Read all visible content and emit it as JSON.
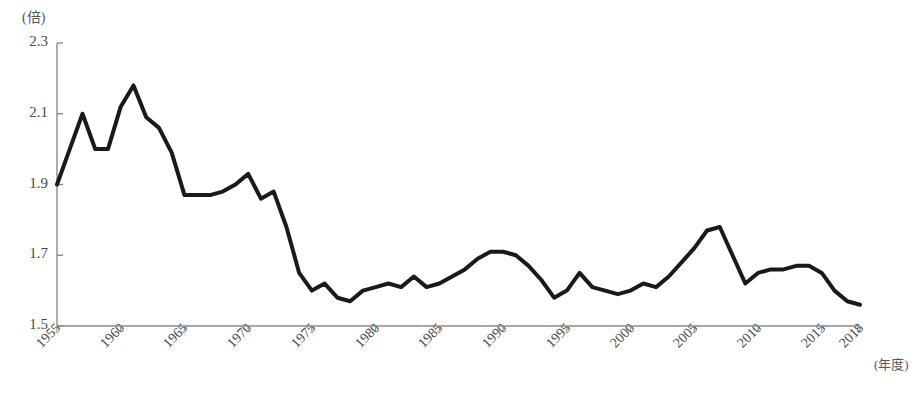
{
  "chart_data": {
    "type": "line",
    "title": "",
    "subtitle": "",
    "xlabel": "(年度)",
    "ylabel": "(倍)",
    "ylim": [
      1.5,
      2.3
    ],
    "xlim": [
      1955,
      2018
    ],
    "ytick_labels": [
      "2.3",
      "2.1",
      "1.9",
      "1.7",
      "1.5"
    ],
    "ytick_values": [
      2.3,
      2.1,
      1.9,
      1.7,
      1.5
    ],
    "xtick_labels": [
      "1955",
      "1960",
      "1965",
      "1970",
      "1975",
      "1980",
      "1985",
      "1990",
      "1995",
      "2000",
      "2005",
      "2010",
      "2015",
      "2018"
    ],
    "xtick_values": [
      1955,
      1960,
      1965,
      1970,
      1975,
      1980,
      1985,
      1990,
      1995,
      2000,
      2005,
      2010,
      2015,
      2018
    ],
    "grid": false,
    "legend": false,
    "legend_position": "none",
    "line_color": "#1a1a1a",
    "axis_color": "#8a8a8a",
    "line_width": 4,
    "series": [
      {
        "name": "倍率",
        "x": [
          1955,
          1956,
          1957,
          1958,
          1959,
          1960,
          1961,
          1962,
          1963,
          1964,
          1965,
          1966,
          1967,
          1968,
          1969,
          1970,
          1971,
          1972,
          1973,
          1974,
          1975,
          1976,
          1977,
          1978,
          1979,
          1980,
          1981,
          1982,
          1983,
          1984,
          1985,
          1986,
          1987,
          1988,
          1989,
          1990,
          1991,
          1992,
          1993,
          1994,
          1995,
          1996,
          1997,
          1998,
          1999,
          2000,
          2001,
          2002,
          2003,
          2004,
          2005,
          2006,
          2007,
          2008,
          2009,
          2010,
          2011,
          2012,
          2013,
          2014,
          2015,
          2016,
          2017,
          2018
        ],
        "values": [
          1.9,
          2.0,
          2.1,
          2.0,
          2.0,
          2.12,
          2.18,
          2.09,
          2.06,
          1.99,
          1.87,
          1.87,
          1.87,
          1.88,
          1.9,
          1.93,
          1.86,
          1.88,
          1.78,
          1.65,
          1.6,
          1.62,
          1.58,
          1.57,
          1.6,
          1.61,
          1.62,
          1.61,
          1.64,
          1.61,
          1.62,
          1.64,
          1.66,
          1.69,
          1.71,
          1.71,
          1.7,
          1.67,
          1.63,
          1.58,
          1.6,
          1.65,
          1.61,
          1.6,
          1.59,
          1.6,
          1.62,
          1.61,
          1.64,
          1.68,
          1.72,
          1.77,
          1.78,
          1.7,
          1.62,
          1.65,
          1.66,
          1.66,
          1.67,
          1.67,
          1.65,
          1.6,
          1.57,
          1.56
        ]
      }
    ]
  }
}
